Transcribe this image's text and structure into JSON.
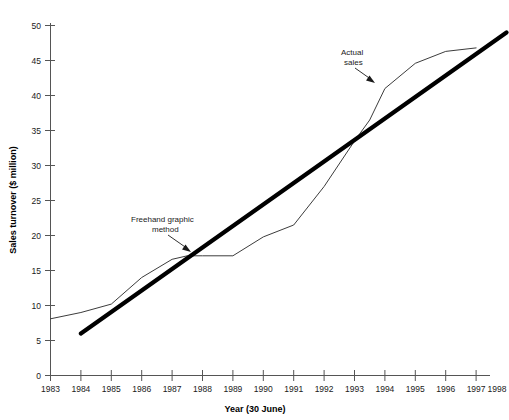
{
  "chart_data": {
    "type": "line",
    "title": "",
    "xlabel": "Year (30 June)",
    "ylabel": "Sales turnover ($ million)",
    "xlim": [
      1983,
      1998
    ],
    "ylim": [
      0,
      50
    ],
    "grid": false,
    "legend_position": "none",
    "x_tick_labels": [
      "1983",
      "1984",
      "1985",
      "1986",
      "1987",
      "1988",
      "1989",
      "1990",
      "1991",
      "1992",
      "1993",
      "1994",
      "1995",
      "1996",
      "1997",
      "1998"
    ],
    "y_tick_labels": [
      "0",
      "5",
      "10",
      "15",
      "20",
      "25",
      "30",
      "35",
      "40",
      "45",
      "50"
    ],
    "y_ticks": [
      0,
      5,
      10,
      15,
      20,
      25,
      30,
      35,
      40,
      45,
      50
    ],
    "series": [
      {
        "name": "Actual sales",
        "style": "thin-line",
        "color": "#3c3c3c",
        "x": [
          1983,
          1984,
          1985,
          1986,
          1987,
          1987.5,
          1988,
          1989,
          1990,
          1991,
          1992,
          1993,
          1993.5,
          1994,
          1995,
          1996,
          1997
        ],
        "values": [
          8.1,
          9.0,
          10.2,
          14.0,
          16.6,
          17.1,
          17.1,
          17.1,
          19.8,
          21.5,
          27.0,
          33.5,
          36.5,
          41.0,
          44.6,
          46.3,
          46.8
        ]
      },
      {
        "name": "Freehand graphic method",
        "style": "thick-line",
        "color": "#000000",
        "x": [
          1984,
          1998
        ],
        "values": [
          6.0,
          49.0
        ]
      }
    ],
    "annotations": [
      {
        "name": "freehand-annotation",
        "text_lines": [
          "Freehand graphic",
          "method"
        ],
        "text_x": 1987.0,
        "text_y": 21.5,
        "target_x": 1988.0,
        "target_y": 18.5
      },
      {
        "name": "actual-sales-annotation",
        "text_lines": [
          "Actual",
          "sales"
        ],
        "text_x": 1993.2,
        "text_y": 47.2,
        "target_x": 1994.1,
        "target_y": 43.0
      }
    ]
  }
}
